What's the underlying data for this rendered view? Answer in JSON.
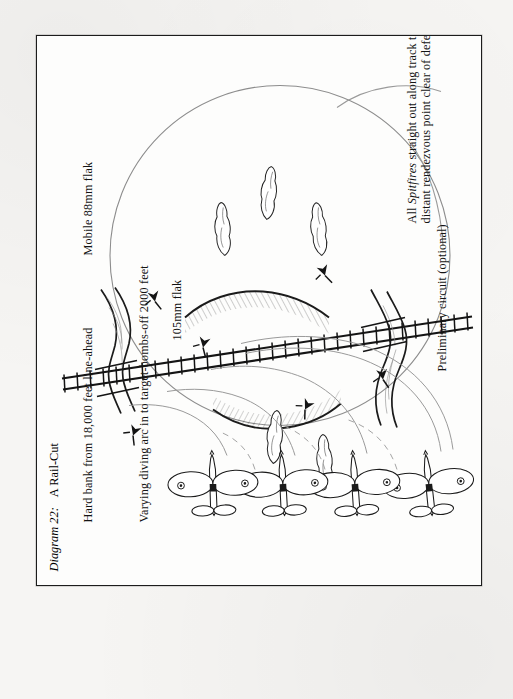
{
  "page": {
    "background_color": "#f6f5f3",
    "plate_color": "#fdfdfc",
    "ink_color": "#141414"
  },
  "caption": {
    "number": "Diagram 22:",
    "title": "A Rail-Cut"
  },
  "labels": {
    "hard_bank": "Hard bank from 18,000 feet line-ahead",
    "diving_arc": "Varying diving arc in to target-bombs-off 2000 feet",
    "flak_88": "Mobile 88mm flak",
    "flak_105": "105mm flak",
    "preliminary_circuit": "Preliminary circuit (optional)",
    "egress_line_1_pre": "All ",
    "egress_line_1_em": "Spitfires",
    "egress_line_1_post": " straight out along track to",
    "egress_line_2": "distant rendezvous point clear of defences"
  },
  "diagram": {
    "type": "tactical-attack-diagram",
    "aircraft_count": 4,
    "aircraft_symbol": "spitfire-planform",
    "railway": "double-rail-with-sleepers",
    "features": [
      "railway-line",
      "river-crossings",
      "railway-cutting-embankment",
      "woodland-copses",
      "flak-gun-positions",
      "attack-circle",
      "diving-arc-trails"
    ],
    "flak_positions": 6,
    "copse_count": 5,
    "river_count": 3
  }
}
